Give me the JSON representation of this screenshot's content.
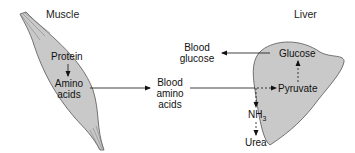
{
  "organs": {
    "muscle": {
      "title": "Muscle",
      "fill": "#c9c9c9",
      "stroke": "#555555"
    },
    "liver": {
      "title": "Liver",
      "fill": "#c9c9c9",
      "stroke": "#555555"
    }
  },
  "nodes": {
    "protein": "Protein",
    "amino_acids_line1": "Amino",
    "amino_acids_line2": "acids",
    "blood_amino_line1": "Blood",
    "blood_amino_line2": "amino",
    "blood_amino_line3": "acids",
    "blood_glucose_line1": "Blood",
    "blood_glucose_line2": "glucose",
    "glucose": "Glucose",
    "pyruvate": "Pyruvate",
    "nh3_base": "NH",
    "nh3_sub": "3",
    "urea": "Urea"
  },
  "edges": [
    {
      "from": "Protein",
      "to": "Amino acids",
      "style": "solid"
    },
    {
      "from": "Amino acids",
      "to": "Blood amino acids",
      "style": "solid"
    },
    {
      "from": "Blood amino acids",
      "to": "Liver",
      "style": "solid"
    },
    {
      "from": "Liver",
      "to": "Pyruvate",
      "style": "dashed"
    },
    {
      "from": "Liver",
      "to": "NH3",
      "style": "dashed"
    },
    {
      "from": "NH3",
      "to": "Urea",
      "style": "dashed"
    },
    {
      "from": "Pyruvate",
      "to": "Glucose",
      "style": "dashed"
    },
    {
      "from": "Glucose",
      "to": "Blood glucose",
      "style": "solid"
    }
  ]
}
